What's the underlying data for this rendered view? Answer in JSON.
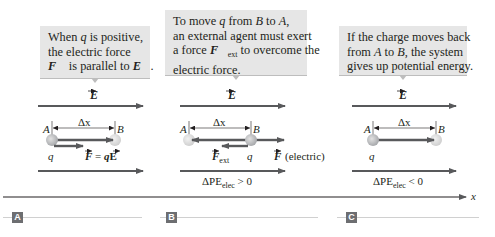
{
  "panels": [
    {
      "label": "A",
      "callout": [
        "When q is positive,",
        "the electric force",
        "F is parallel to E."
      ],
      "field_label": "E",
      "point_a": "A",
      "point_b": "B",
      "displacement": "Δx",
      "charge": "q",
      "force_label": "F = qE",
      "delta_pe": ""
    },
    {
      "label": "B",
      "callout": [
        "To move q from B to A,",
        "an external agent must exert",
        "a force F_ext to overcome the",
        "electric force."
      ],
      "field_label": "E",
      "point_a": "A",
      "point_b": "B",
      "displacement": "Δx",
      "charge": "q",
      "force_ext_label": "F",
      "force_ext_sub": "ext",
      "force_electric_label": "F",
      "force_electric_note": "(electric)",
      "delta_pe": "ΔPE",
      "delta_pe_sub": "elec",
      "delta_pe_rel": " > 0"
    },
    {
      "label": "C",
      "callout": [
        "If the charge moves back",
        "from A to B, the system",
        "gives up potential energy."
      ],
      "field_label": "E",
      "point_a": "A",
      "point_b": "B",
      "displacement": "Δx",
      "charge": "q",
      "delta_pe": "ΔPE",
      "delta_pe_sub": "elec",
      "delta_pe_rel": " < 0"
    }
  ],
  "axis": {
    "label": "x"
  },
  "colors": {
    "callout_bg": "#e6e6e6",
    "arrow": "#58595b",
    "charge": "#b5b5b5",
    "panel_label_bg": "#6d6e71"
  }
}
